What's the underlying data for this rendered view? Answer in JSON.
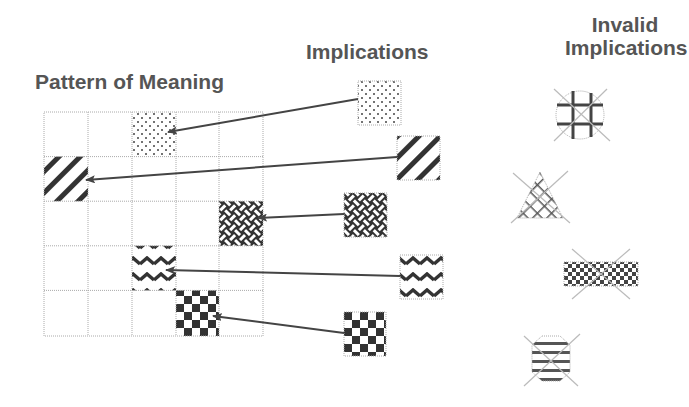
{
  "titles": {
    "pattern_of_meaning": "Pattern of Meaning",
    "implications": "Implications",
    "invalid_implications_line1": "Invalid",
    "invalid_implications_line2": "Implications"
  },
  "grid": {
    "rows": 5,
    "cols": 5,
    "filled_cells": [
      {
        "row": 0,
        "col": 2,
        "pattern": "dots"
      },
      {
        "row": 1,
        "col": 0,
        "pattern": "diagonal-stripes"
      },
      {
        "row": 2,
        "col": 4,
        "pattern": "weave"
      },
      {
        "row": 3,
        "col": 2,
        "pattern": "zigzag"
      },
      {
        "row": 4,
        "col": 3,
        "pattern": "checker"
      }
    ]
  },
  "implications": [
    {
      "pattern": "dots",
      "target": "row 0, col 2"
    },
    {
      "pattern": "diagonal-stripes",
      "target": "row 1, col 0"
    },
    {
      "pattern": "weave",
      "target": "row 2, col 4"
    },
    {
      "pattern": "zigzag",
      "target": "row 3, col 2"
    },
    {
      "pattern": "checker",
      "target": "row 4, col 3"
    }
  ],
  "invalid_implications": [
    {
      "shape": "circle",
      "pattern": "grid",
      "crossed_out": true
    },
    {
      "shape": "triangle",
      "pattern": "crosshatch",
      "crossed_out": true
    },
    {
      "shape": "rectangle",
      "pattern": "checker",
      "crossed_out": true
    },
    {
      "shape": "circle",
      "pattern": "horizontal-stripes",
      "crossed_out": true
    }
  ],
  "colors": {
    "text": "#555555",
    "ink": "#333333",
    "grid_line": "#aaaaaa",
    "cross": "#bbbbbb"
  }
}
